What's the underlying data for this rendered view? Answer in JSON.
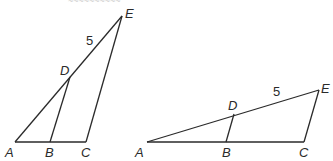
{
  "top_cutoff_text": "~~~~~~~~~~",
  "figures": [
    {
      "name": "figure-left",
      "points": {
        "A": {
          "label": "A",
          "x": 15,
          "y": 142
        },
        "B": {
          "label": "B",
          "x": 50,
          "y": 142
        },
        "C": {
          "label": "C",
          "x": 86,
          "y": 142
        },
        "D": {
          "label": "D",
          "x": 70,
          "y": 77
        },
        "E": {
          "label": "E",
          "x": 122,
          "y": 16
        }
      },
      "segments": [
        [
          "A",
          "C"
        ],
        [
          "A",
          "E"
        ],
        [
          "E",
          "C"
        ],
        [
          "D",
          "B"
        ]
      ],
      "length_label": {
        "text": "5",
        "on": "DE"
      }
    },
    {
      "name": "figure-right",
      "points": {
        "A": {
          "label": "A",
          "x": 147,
          "y": 142
        },
        "B": {
          "label": "B",
          "x": 226,
          "y": 142
        },
        "C": {
          "label": "C",
          "x": 304,
          "y": 142
        },
        "D": {
          "label": "D",
          "x": 234,
          "y": 114
        },
        "E": {
          "label": "E",
          "x": 319,
          "y": 90
        }
      },
      "segments": [
        [
          "A",
          "C"
        ],
        [
          "A",
          "E"
        ],
        [
          "E",
          "C"
        ],
        [
          "D",
          "B"
        ]
      ],
      "length_label": {
        "text": "5",
        "on": "DE"
      }
    }
  ]
}
